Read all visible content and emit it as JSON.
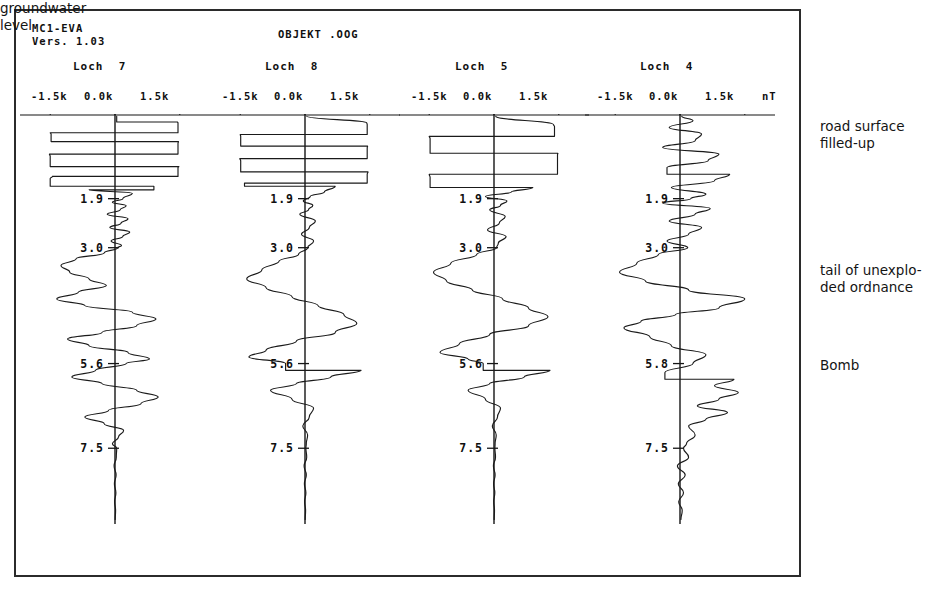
{
  "header": {
    "device_id": "MC1-EVA",
    "version": "Vers. 1.03",
    "object_name": "OBJEKT .OOG",
    "unit": "nT"
  },
  "axis": {
    "tick_labels": [
      "-1.5k",
      "0.0k",
      "1.5k"
    ],
    "tick_values": [
      -1500,
      0,
      1500
    ],
    "unit": "nT"
  },
  "annotations": {
    "road_surface": "road surface\nfilled-up",
    "tail_ordnance": "tail of unexplo-\nded ordnance",
    "bomb": "Bomb",
    "groundwater": "groundwater\nlevel"
  },
  "tracks": [
    {
      "name": "Loch  7",
      "depth_labels": [
        "1.9",
        "3.0",
        "5.6",
        "7.5"
      ]
    },
    {
      "name": "Loch  8",
      "depth_labels": [
        "1.9",
        "3.0",
        "5.6",
        "7.5"
      ]
    },
    {
      "name": "Loch  5",
      "depth_labels": [
        "1.9",
        "3.0",
        "5.6",
        "7.5"
      ]
    },
    {
      "name": "Loch  4",
      "depth_labels": [
        "1.9",
        "3.0",
        "5.8",
        "7.5"
      ]
    }
  ],
  "chart_data": {
    "type": "line",
    "title": "OBJEKT .OOG",
    "xlabel": "nT",
    "ylabel": "depth (m)",
    "xlim": [
      -2200,
      2200
    ],
    "ylim": [
      0,
      9.2
    ],
    "grid": false,
    "legend": "none",
    "orientation": "vertical-depth-log",
    "xtick_values": [
      -1500,
      0,
      1500
    ],
    "xtick_labels": [
      "-1.5k",
      "0.0k",
      "1.5k"
    ],
    "depth_ticks": [
      1.9,
      3.0,
      5.6,
      7.5
    ],
    "series": [
      {
        "name": "Loch  7",
        "depth_labels": [
          "1.9",
          "3.0",
          "5.6",
          "7.5"
        ],
        "depths": [
          0.05,
          0.18,
          0.2,
          0.42,
          0.45,
          0.62,
          0.66,
          0.9,
          0.95,
          1.18,
          1.2,
          1.4,
          1.45,
          1.62,
          1.7,
          1.78,
          1.9,
          1.98,
          2.06,
          2.15,
          2.25,
          2.35,
          2.45,
          2.55,
          2.65,
          2.75,
          2.85,
          2.95,
          3.0,
          3.12,
          3.25,
          3.4,
          3.55,
          3.7,
          3.85,
          4.0,
          4.15,
          4.3,
          4.45,
          4.6,
          4.75,
          4.9,
          5.05,
          5.2,
          5.35,
          5.5,
          5.6,
          5.75,
          5.9,
          6.05,
          6.2,
          6.35,
          6.5,
          6.65,
          6.8,
          6.95,
          7.1,
          7.25,
          7.4,
          7.5,
          7.7,
          7.9,
          8.1,
          8.3,
          8.5,
          8.7,
          8.9,
          9.1
        ],
        "values": [
          40,
          1450,
          1460,
          -1500,
          -1480,
          1470,
          1460,
          -1520,
          -1500,
          1480,
          1460,
          -1450,
          -1500,
          900,
          -600,
          400,
          180,
          -60,
          260,
          120,
          -180,
          300,
          140,
          -120,
          340,
          180,
          -90,
          150,
          60,
          -250,
          -900,
          -1250,
          -1050,
          -600,
          -200,
          -850,
          -1350,
          -700,
          400,
          950,
          500,
          -300,
          -1100,
          -600,
          300,
          800,
          260,
          -450,
          -1000,
          -300,
          500,
          1000,
          600,
          -150,
          -700,
          -250,
          200,
          80,
          -60,
          40,
          30,
          -20,
          25,
          -15,
          20,
          -10,
          15,
          5
        ]
      },
      {
        "name": "Loch  8",
        "depth_labels": [
          "1.9",
          "3.0",
          "5.6",
          "7.5"
        ],
        "depths": [
          0.05,
          0.2,
          0.24,
          0.46,
          0.5,
          0.72,
          0.76,
          1.0,
          1.05,
          1.3,
          1.35,
          1.55,
          1.62,
          1.75,
          1.85,
          1.95,
          2.05,
          2.15,
          2.25,
          2.4,
          2.55,
          2.7,
          2.85,
          3.0,
          3.15,
          3.3,
          3.5,
          3.7,
          3.9,
          4.1,
          4.3,
          4.5,
          4.7,
          4.9,
          5.1,
          5.3,
          5.45,
          5.6,
          5.75,
          5.9,
          6.05,
          6.2,
          6.4,
          6.6,
          6.8,
          7.0,
          7.2,
          7.4,
          7.5,
          7.7,
          7.9,
          8.1,
          8.3,
          8.5,
          8.7,
          8.9,
          9.1
        ],
        "values": [
          40,
          1430,
          1440,
          -1500,
          -1490,
          1450,
          1440,
          -1510,
          -1490,
          1460,
          1440,
          -1400,
          700,
          450,
          120,
          -40,
          180,
          80,
          -120,
          240,
          100,
          -80,
          200,
          60,
          -150,
          -600,
          -1000,
          -1350,
          -900,
          -300,
          300,
          900,
          1200,
          700,
          -200,
          -900,
          -1300,
          -450,
          1300,
          600,
          -200,
          -800,
          -300,
          200,
          100,
          -50,
          60,
          30,
          20,
          40,
          -20,
          30,
          -15,
          20,
          -10,
          15,
          5
        ]
      },
      {
        "name": "Loch  5",
        "depth_labels": [
          "1.9",
          "3.0",
          "5.6",
          "7.5"
        ],
        "depths": [
          0.05,
          0.24,
          0.28,
          0.5,
          0.55,
          0.88,
          0.92,
          1.35,
          1.42,
          1.65,
          1.75,
          1.85,
          1.95,
          2.05,
          2.15,
          2.3,
          2.45,
          2.6,
          2.75,
          2.9,
          3.0,
          3.15,
          3.35,
          3.55,
          3.75,
          3.95,
          4.15,
          4.35,
          4.55,
          4.75,
          4.95,
          5.15,
          5.35,
          5.5,
          5.6,
          5.75,
          5.9,
          6.05,
          6.2,
          6.4,
          6.6,
          6.8,
          7.0,
          7.2,
          7.4,
          7.5,
          7.7,
          7.9,
          8.1,
          8.3,
          8.5,
          8.7,
          8.9,
          9.1
        ],
        "values": [
          40,
          1380,
          1400,
          -1500,
          -1480,
          1480,
          1470,
          -1500,
          -1480,
          900,
          400,
          -200,
          300,
          150,
          -100,
          260,
          120,
          -150,
          280,
          100,
          60,
          -400,
          -1000,
          -1400,
          -1100,
          -500,
          200,
          800,
          1250,
          800,
          -100,
          -800,
          -1250,
          -600,
          -250,
          1300,
          700,
          -100,
          -600,
          -200,
          150,
          80,
          -40,
          50,
          25,
          20,
          35,
          -15,
          25,
          -10,
          18,
          -8,
          12,
          5
        ]
      },
      {
        "name": "Loch  4",
        "depth_labels": [
          "1.9",
          "3.0",
          "5.8",
          "7.5"
        ],
        "depths": [
          0.05,
          0.15,
          0.3,
          0.45,
          0.6,
          0.75,
          0.9,
          1.05,
          1.2,
          1.35,
          1.5,
          1.65,
          1.8,
          1.9,
          2.0,
          2.12,
          2.25,
          2.4,
          2.55,
          2.7,
          2.85,
          3.0,
          3.15,
          3.35,
          3.55,
          3.75,
          3.95,
          4.15,
          4.35,
          4.5,
          4.65,
          4.8,
          5.0,
          5.2,
          5.4,
          5.6,
          5.8,
          5.95,
          6.1,
          6.25,
          6.4,
          6.55,
          6.7,
          6.85,
          7.0,
          7.2,
          7.4,
          7.5,
          7.7,
          7.9,
          8.1,
          8.3,
          8.5,
          8.7,
          8.9,
          9.1
        ],
        "values": [
          40,
          300,
          -250,
          500,
          350,
          -400,
          900,
          650,
          -300,
          1150,
          800,
          -200,
          600,
          250,
          -400,
          700,
          350,
          -250,
          500,
          200,
          -300,
          180,
          -500,
          -1000,
          -1400,
          -800,
          200,
          1500,
          900,
          -100,
          -900,
          -1300,
          -700,
          -200,
          600,
          300,
          -350,
          1250,
          800,
          1350,
          900,
          400,
          1100,
          600,
          200,
          350,
          150,
          80,
          200,
          -60,
          120,
          -40,
          80,
          -30,
          50,
          20
        ]
      }
    ]
  }
}
